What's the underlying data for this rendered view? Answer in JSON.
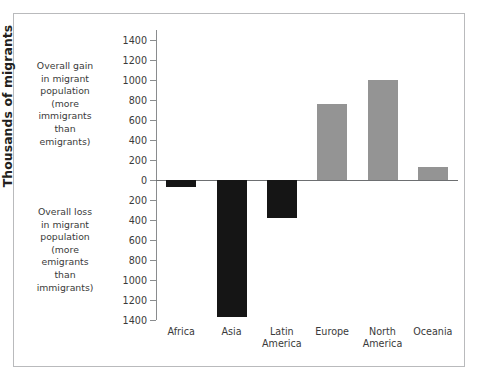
{
  "chart_data": {
    "type": "bar",
    "title": "",
    "xlabel": "",
    "ylabel": "Thousands of migrants",
    "categories": [
      "Africa",
      "Asia",
      "Latin America",
      "Europe",
      "North America",
      "Oceania"
    ],
    "values": [
      -70,
      -1370,
      -380,
      760,
      1000,
      130
    ],
    "ylim": [
      -1400,
      1400
    ],
    "ytick_values": [
      1400,
      1200,
      1000,
      800,
      600,
      400,
      200,
      0,
      -200,
      -400,
      -600,
      -800,
      -1000,
      -1200,
      -1400
    ],
    "ytick_labels": [
      "1400",
      "1200",
      "1000",
      "800",
      "600",
      "400",
      "200",
      "0",
      "200",
      "400",
      "600",
      "800",
      "1000",
      "1200",
      "1400"
    ],
    "grid": false,
    "legend": "none",
    "series": [
      {
        "name": "Net migration",
        "values": [
          -70,
          -1370,
          -380,
          760,
          1000,
          130
        ]
      }
    ],
    "colors": {
      "positive_bar": "#949494",
      "negative_bar": "#151515",
      "axis": "#8a8c8e",
      "text": "#3a3a3a",
      "frame": "#b9babc",
      "background": "#ffffff"
    }
  },
  "annotations": {
    "gain": "Overall gain in migrant population (more immigrants than emigrants)",
    "loss": "Overall loss in migrant population (more emigrants than immigrants)",
    "gain_lines": [
      "Overall gain",
      "in migrant",
      "population",
      "(more",
      "immigrants",
      "than",
      "emigrants)"
    ],
    "loss_lines": [
      "Overall loss",
      "in migrant",
      "population",
      "(more",
      "emigrants",
      "than",
      "immigrants)"
    ]
  },
  "category_lines": [
    [
      "Africa"
    ],
    [
      "Asia"
    ],
    [
      "Latin",
      "America"
    ],
    [
      "Europe"
    ],
    [
      "North",
      "America"
    ],
    [
      "Oceania"
    ]
  ]
}
